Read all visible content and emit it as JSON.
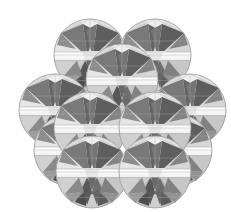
{
  "figure": {
    "title": "Close-packed array of faceted spheres",
    "background_color": "#ffffff",
    "canvas": {
      "width": 231,
      "height": 212
    },
    "sphere_radius": 36,
    "outline_color": "#9a9a9a",
    "outline_width": 0.8,
    "palette": {
      "sphere_fill": "#ececec",
      "highlight": "#fbfbfb",
      "white_band": "#ffffff",
      "light_facet": "#e2e2e2",
      "mid_light_facet": "#cccccc",
      "mid_facet": "#b2b2b2",
      "mid_dark_facet": "#8e8e8e",
      "dark_facet": "#6b6b6b",
      "darkest_facet": "#4f4f4f",
      "edge_line": "#a8a8a8"
    },
    "spheres": [
      {
        "id": "sphere-top-left",
        "cx": 90,
        "cy": 55,
        "r": 36,
        "z": 1,
        "row": "top",
        "col": 1
      },
      {
        "id": "sphere-top-right",
        "cx": 155,
        "cy": 55,
        "r": 36,
        "z": 2,
        "row": "top",
        "col": 2
      },
      {
        "id": "sphere-upper-center",
        "cx": 122,
        "cy": 80,
        "r": 36,
        "z": 6,
        "row": "upper",
        "col": 1
      },
      {
        "id": "sphere-mid-far-left",
        "cx": 55,
        "cy": 110,
        "r": 36,
        "z": 1,
        "row": "middle",
        "col": 1
      },
      {
        "id": "sphere-mid-far-right",
        "cx": 190,
        "cy": 110,
        "r": 36,
        "z": 2,
        "row": "middle",
        "col": 4
      },
      {
        "id": "sphere-mid-left",
        "cx": 90,
        "cy": 128,
        "r": 36,
        "z": 7,
        "row": "middle",
        "col": 2
      },
      {
        "id": "sphere-mid-right",
        "cx": 155,
        "cy": 128,
        "r": 36,
        "z": 8,
        "row": "middle",
        "col": 3
      },
      {
        "id": "sphere-lower-left",
        "cx": 70,
        "cy": 150,
        "r": 36,
        "z": 4,
        "row": "lower",
        "col": 1
      },
      {
        "id": "sphere-lower-right",
        "cx": 176,
        "cy": 150,
        "r": 36,
        "z": 5,
        "row": "lower",
        "col": 2
      },
      {
        "id": "sphere-bottom-left",
        "cx": 92,
        "cy": 172,
        "r": 36,
        "z": 9,
        "row": "bottom",
        "col": 1
      },
      {
        "id": "sphere-bottom-right",
        "cx": 155,
        "cy": 172,
        "r": 36,
        "z": 10,
        "row": "bottom",
        "col": 2
      }
    ],
    "facet_pattern": {
      "name": "tristar-polyhedron",
      "star_arms": 3,
      "star_arm_angles_deg": [
        270,
        30,
        150
      ],
      "equator_band_height_ratio": 0.16,
      "center_triangle_scale": 0.34
    }
  }
}
